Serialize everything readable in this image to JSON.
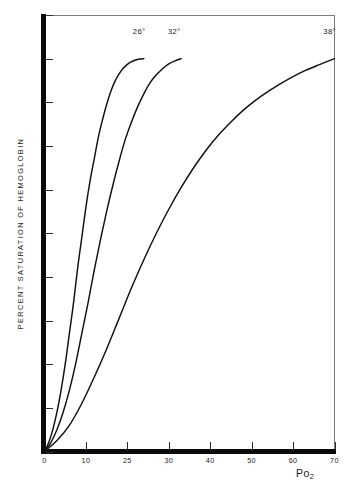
{
  "chart_data": {
    "type": "line",
    "title": "",
    "subtitle": "",
    "xlabel": "Po2",
    "xlabel_display": "Po",
    "xlabel_sub": "2",
    "ylabel": "PERCENT  SATURATION  OF  HEMOGLOBIN",
    "xlim": [
      0,
      70
    ],
    "ylim": [
      0,
      100
    ],
    "xticks": [
      0,
      10,
      20,
      30,
      40,
      50,
      60,
      70
    ],
    "xtick_labels": [
      "0",
      "10",
      "25",
      "30",
      "40",
      "50",
      "60",
      "70"
    ],
    "yticks": [
      0,
      10,
      20,
      30,
      40,
      50,
      60,
      70,
      80,
      90,
      100
    ],
    "ytick_labels": [
      "0",
      "10",
      "20",
      "30",
      "40",
      "50",
      "60",
      "70",
      "80",
      "90",
      "100"
    ],
    "grid": false,
    "legend": "inline-curve-labels",
    "legend_position": "above-curve-ends",
    "line_color": "#101010",
    "annotations": [
      {
        "name": "curve-label-26",
        "text": "26°",
        "x": 23,
        "y": 96
      },
      {
        "name": "curve-label-32",
        "text": "32°",
        "x": 31.5,
        "y": 96
      },
      {
        "name": "curve-label-38",
        "text": "38°",
        "x": 69,
        "y": 96
      }
    ],
    "series": [
      {
        "name": "26°",
        "label": "26°",
        "x": [
          0,
          1,
          2,
          3,
          4,
          5,
          6,
          7,
          8,
          9,
          10,
          11,
          12,
          13,
          14,
          15,
          16,
          17,
          18,
          19,
          20,
          21,
          22,
          23,
          24
        ],
        "values": [
          0,
          2,
          5,
          9,
          14,
          20,
          27,
          34,
          42,
          49,
          56,
          62,
          67,
          72,
          76,
          79.5,
          82.5,
          84.8,
          86.5,
          87.8,
          88.7,
          89.3,
          89.7,
          89.9,
          90
        ]
      },
      {
        "name": "32°",
        "label": "32°",
        "x": [
          0,
          1.5,
          3,
          4.5,
          6,
          7.5,
          9,
          10.5,
          12,
          13.5,
          15,
          16.5,
          18,
          19.5,
          21,
          22.5,
          24,
          25.5,
          27,
          28.5,
          30,
          31.5,
          33
        ],
        "values": [
          0,
          2,
          5,
          9,
          14,
          20,
          27,
          34,
          41.5,
          48.5,
          55,
          61,
          66.5,
          71.5,
          75.5,
          79,
          82,
          84.5,
          86.3,
          87.7,
          88.8,
          89.5,
          90
        ]
      },
      {
        "name": "38°",
        "label": "38°",
        "x": [
          0,
          3,
          6,
          9,
          12,
          15,
          18,
          21,
          24,
          27,
          30,
          33,
          36,
          39,
          42,
          45,
          48,
          51,
          54,
          57,
          60,
          63,
          66,
          70
        ],
        "values": [
          0,
          2.5,
          6,
          11,
          17,
          23.5,
          30.5,
          37.5,
          44,
          50,
          55.5,
          60.5,
          65,
          69,
          72.5,
          75.5,
          78.2,
          80.5,
          82.5,
          84.3,
          85.9,
          87.3,
          88.5,
          90
        ]
      }
    ]
  },
  "axes": {
    "y_title": "PERCENT  SATURATION  OF  HEMOGLOBIN",
    "x_title_main": "Po",
    "x_title_sub": "2"
  }
}
